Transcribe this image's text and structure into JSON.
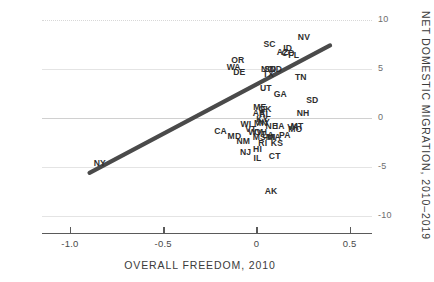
{
  "chart_data": {
    "type": "scatter",
    "title": "",
    "xlabel": "OVERALL FREEDOM, 2010",
    "ylabel": "NET DOMESTIC MIGRATION, 2010–2019",
    "xlim": [
      -1.15,
      0.62
    ],
    "ylim": [
      -11.5,
      11.5
    ],
    "xticks": [
      -1.0,
      -0.5,
      0,
      0.5
    ],
    "xtick_labels": [
      "-1.0",
      "-0.5",
      "0",
      "0.5"
    ],
    "yticks": [
      10,
      5,
      0,
      -5,
      -10
    ],
    "ytick_labels": [
      "10",
      "5",
      "0",
      "-5",
      "-10"
    ],
    "grid": true,
    "legend": "none",
    "point_label_type": "state-abbreviation",
    "points": [
      {
        "label": "NV",
        "x": 0.255,
        "y": 8.3
      },
      {
        "label": "SC",
        "x": 0.07,
        "y": 7.6
      },
      {
        "label": "ID",
        "x": 0.168,
        "y": 7.1
      },
      {
        "label": "AZ",
        "x": 0.14,
        "y": 6.7
      },
      {
        "label": "CO",
        "x": 0.17,
        "y": 6.6
      },
      {
        "label": "FL",
        "x": 0.2,
        "y": 6.4
      },
      {
        "label": "OR",
        "x": -0.1,
        "y": 5.9
      },
      {
        "label": "WA",
        "x": -0.122,
        "y": 5.2
      },
      {
        "label": "DE",
        "x": -0.092,
        "y": 4.7
      },
      {
        "label": "NC",
        "x": 0.058,
        "y": 5.0
      },
      {
        "label": "SD",
        "x": 0.074,
        "y": 5.0
      },
      {
        "label": "ND",
        "x": 0.104,
        "y": 5.0
      },
      {
        "label": "TX",
        "x": 0.064,
        "y": 4.5
      },
      {
        "label": "TN",
        "x": 0.238,
        "y": 4.2
      },
      {
        "label": "UT",
        "x": 0.05,
        "y": 3.1
      },
      {
        "label": "GA",
        "x": 0.128,
        "y": 2.4
      },
      {
        "label": "SD",
        "x": 0.3,
        "y": 1.8
      },
      {
        "label": "ME",
        "x": 0.018,
        "y": 1.1
      },
      {
        "label": "OK",
        "x": 0.046,
        "y": 0.9
      },
      {
        "label": "AR",
        "x": 0.014,
        "y": 0.5
      },
      {
        "label": "AL",
        "x": 0.046,
        "y": 0.4
      },
      {
        "label": "NH",
        "x": 0.25,
        "y": 0.5
      },
      {
        "label": "KY",
        "x": 0.032,
        "y": -0.1
      },
      {
        "label": "NY",
        "x": 0.04,
        "y": -0.4
      },
      {
        "label": "MN",
        "x": 0.024,
        "y": -0.5
      },
      {
        "label": "WI",
        "x": -0.056,
        "y": -0.6
      },
      {
        "label": "VT",
        "x": -0.03,
        "y": -1.1
      },
      {
        "label": "NE",
        "x": 0.082,
        "y": -0.8
      },
      {
        "label": "IA",
        "x": 0.128,
        "y": -0.8
      },
      {
        "label": "VA",
        "x": 0.196,
        "y": -0.9
      },
      {
        "label": "MT",
        "x": 0.218,
        "y": -0.8
      },
      {
        "label": "MO",
        "x": 0.208,
        "y": -1.1
      },
      {
        "label": "WV",
        "x": -0.006,
        "y": -1.4
      },
      {
        "label": "OH",
        "x": 0.022,
        "y": -1.4
      },
      {
        "label": "CA",
        "x": -0.192,
        "y": -1.3
      },
      {
        "label": "MD",
        "x": -0.118,
        "y": -1.8
      },
      {
        "label": "MS",
        "x": 0.016,
        "y": -1.9
      },
      {
        "label": "MI",
        "x": 0.076,
        "y": -1.9
      },
      {
        "label": "LA",
        "x": 0.062,
        "y": -1.7
      },
      {
        "label": "MA",
        "x": 0.094,
        "y": -1.9
      },
      {
        "label": "PA",
        "x": 0.152,
        "y": -1.7
      },
      {
        "label": "NM",
        "x": -0.07,
        "y": -2.3
      },
      {
        "label": "RI",
        "x": 0.034,
        "y": -2.6
      },
      {
        "label": "KS",
        "x": 0.11,
        "y": -2.6
      },
      {
        "label": "NJ",
        "x": -0.058,
        "y": -3.5
      },
      {
        "label": "HI",
        "x": 0.006,
        "y": -3.2
      },
      {
        "label": "IL",
        "x": 0.006,
        "y": -4.1
      },
      {
        "label": "CT",
        "x": 0.098,
        "y": -3.9
      },
      {
        "label": "NY",
        "x": -0.84,
        "y": -4.6
      },
      {
        "label": "AK",
        "x": 0.078,
        "y": -7.4
      }
    ],
    "trendline": {
      "type": "linear-fit",
      "x_start": -0.895,
      "y_start": -5.6,
      "x_end": 0.395,
      "y_end": 7.4,
      "color": "#4a4a4a"
    }
  }
}
